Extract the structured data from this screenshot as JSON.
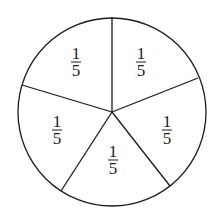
{
  "diagram": {
    "type": "circle-divided-into-equal-sectors",
    "sector_count": 5,
    "stroke_color": "#1a1a1a",
    "fill_color": "#ffffff",
    "circle": {
      "cx": 112,
      "cy": 112,
      "r": 94
    },
    "spokes": [
      {
        "x": 112,
        "y": 17
      },
      {
        "x": 198,
        "y": 78
      },
      {
        "x": 170,
        "y": 186
      },
      {
        "x": 61,
        "y": 191
      },
      {
        "x": 22,
        "y": 85
      }
    ],
    "sectors": [
      {
        "label_num": "1",
        "label_den": "5",
        "x": 76,
        "y": 62
      },
      {
        "label_num": "1",
        "label_den": "5",
        "x": 141,
        "y": 62
      },
      {
        "label_num": "1",
        "label_den": "5",
        "x": 167,
        "y": 130
      },
      {
        "label_num": "1",
        "label_den": "5",
        "x": 113,
        "y": 160
      },
      {
        "label_num": "1",
        "label_den": "5",
        "x": 57,
        "y": 130
      }
    ]
  }
}
